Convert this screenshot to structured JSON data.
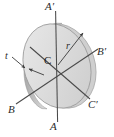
{
  "figure": {
    "type": "engineering-diagram",
    "labels": {
      "axis_a_top": "A′",
      "axis_a_bottom": "A",
      "axis_b_right": "B′",
      "axis_b_left": "B",
      "axis_c_right": "C′",
      "axis_c_left": "C",
      "center": "C",
      "radius": "r",
      "thickness": "t"
    },
    "icons": {
      "radius_arrow": "radius-arrow-icon",
      "thickness_arrow": "thickness-arrow-icon"
    },
    "colors": {
      "disk_face": "#d4d4d4",
      "disk_face_light": "#e8e8e8",
      "disk_edge": "#b9b9b9",
      "disk_outline": "#9a9a9a",
      "axis_line": "#4a4a4a",
      "text": "#2b2b2b",
      "background": "#ffffff"
    },
    "geometry": {
      "center_x": 57,
      "center_y": 66,
      "disk_rx": 33,
      "disk_ry": 43,
      "disk_rotation_deg": -18,
      "thickness_offset_px": 5
    }
  }
}
